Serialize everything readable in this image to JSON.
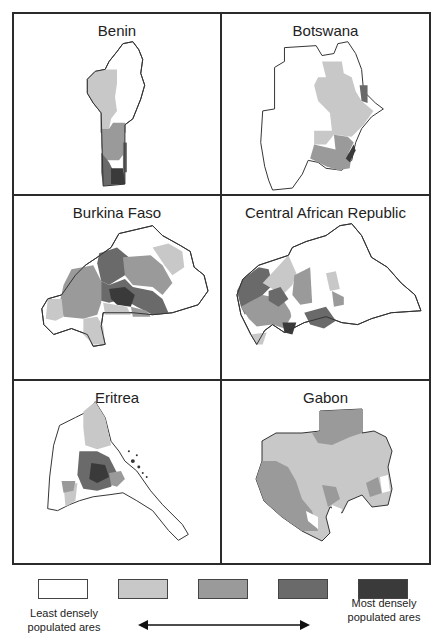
{
  "figure": {
    "panels": [
      {
        "id": "benin",
        "title": "Benin"
      },
      {
        "id": "botswana",
        "title": "Botswana"
      },
      {
        "id": "burkina-faso",
        "title": "Burkina Faso"
      },
      {
        "id": "central-african-republic",
        "title": "Central African Republic"
      },
      {
        "id": "eritrea",
        "title": "Eritrea"
      },
      {
        "id": "gabon",
        "title": "Gabon"
      }
    ]
  },
  "legend": {
    "classes": [
      {
        "level": 1,
        "color": "#ffffff"
      },
      {
        "level": 2,
        "color": "#c8c8c8"
      },
      {
        "level": 3,
        "color": "#9a9a9a"
      },
      {
        "level": 4,
        "color": "#6a6a6a"
      },
      {
        "level": 5,
        "color": "#3a3a3a"
      }
    ],
    "low_label_line1": "Least densely",
    "low_label_line2": "populated ares",
    "high_label_line1": "Most densely",
    "high_label_line2": "populated ares",
    "arrow": "double-headed"
  },
  "colors": {
    "outline": "#2b2b2b",
    "level1": "#ffffff",
    "level2": "#c8c8c8",
    "level3": "#9a9a9a",
    "level4": "#6a6a6a",
    "level5": "#3a3a3a"
  }
}
